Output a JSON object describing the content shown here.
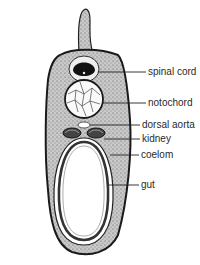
{
  "diagram": {
    "labels": [
      {
        "id": "spinal-cord",
        "text": "spinal cord",
        "x": 148,
        "y": 68
      },
      {
        "id": "notochord",
        "text": "notochord",
        "x": 148,
        "y": 99
      },
      {
        "id": "dorsal-aorta",
        "text": "dorsal aorta",
        "x": 142,
        "y": 121
      },
      {
        "id": "kidney",
        "text": "kidney",
        "x": 142,
        "y": 135
      },
      {
        "id": "coelom",
        "text": "coelom",
        "x": 141,
        "y": 150
      },
      {
        "id": "gut",
        "text": "gut",
        "x": 141,
        "y": 180
      }
    ]
  }
}
